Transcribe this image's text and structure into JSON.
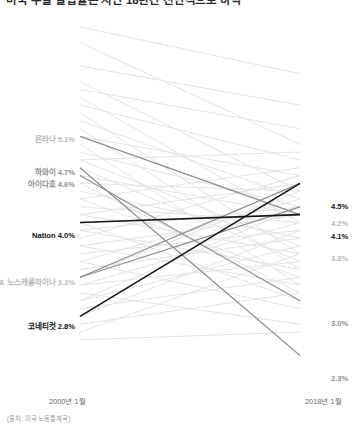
{
  "title": "미국 주별 실업률은 지난 18년간 전반적으로 하락",
  "source_note": "(출처: 미국 노동통계국)",
  "axis": {
    "left_caption": "2000년 1월",
    "right_caption": "2018년 1월"
  },
  "left_labels": [
    {
      "name": "몬타나",
      "value": "5.1%",
      "text": "몬타나 5.1%",
      "tone": "muted"
    },
    {
      "name": "하와이",
      "value": "4.7%",
      "text": "하와이 4.7%",
      "tone": "midtone"
    },
    {
      "name": "아이다호",
      "value": "4.6%",
      "text": "아이다호 4.6%",
      "tone": "midtone"
    },
    {
      "name": "Nation",
      "value": "4.0%",
      "text": "Nation 4.0%",
      "tone": "dark"
    },
    {
      "name": "미시간 & 노스캐롤라이나",
      "value": "3.3%",
      "text": "미시간 & 노스캐롤라이나 3.3%",
      "tone": "muted"
    },
    {
      "name": "코네티컷",
      "value": "2.8%",
      "text": "코네티컷 2.8%",
      "tone": "dark"
    }
  ],
  "right_labels": [
    {
      "value": "4.5%",
      "tone": "dark"
    },
    {
      "value": "4.2%",
      "tone": "muted"
    },
    {
      "value": "4.1%",
      "tone": "dark"
    },
    {
      "value": "3.8%",
      "tone": "muted"
    },
    {
      "value": "3.0%",
      "tone": "midtone"
    },
    {
      "value": "2.3%",
      "tone": "midtone"
    }
  ],
  "colors": {
    "background_line": "#e4e4e4",
    "highlight_line": "#8e8e8e",
    "emphasis_line": "#141414",
    "muted_text": "#b9b9b9",
    "midtone_text": "#8f8f8f",
    "dark_text": "#111111"
  },
  "chart_data": {
    "type": "line",
    "subtype": "slopegraph",
    "title": "미국 주별 실업률은 지난 18년간 전반적으로 하락",
    "xlabel": "",
    "ylabel": "실업률 (%)",
    "x": [
      "2000년 1월",
      "2018년 1월"
    ],
    "ylim": [
      2.0,
      6.6
    ],
    "grid": false,
    "legend": "none",
    "y_axis_inverted_on_screen": true,
    "annotations": {
      "left": [
        "몬타나 5.1%",
        "하와이 4.7%",
        "아이다호 4.6%",
        "Nation 4.0%",
        "미시간 & 노스캐롤라이나 3.3%",
        "코네티컷 2.8%"
      ],
      "right": [
        "4.5%",
        "4.2%",
        "4.1%",
        "3.8%",
        "3.0%",
        "2.3%"
      ]
    },
    "series": [
      {
        "name": "몬타나",
        "values": [
          5.1,
          4.1
        ],
        "emphasis": "highlight"
      },
      {
        "name": "하와이",
        "values": [
          4.7,
          2.3
        ],
        "emphasis": "highlight"
      },
      {
        "name": "아이다호",
        "values": [
          4.6,
          3.0
        ],
        "emphasis": "highlight"
      },
      {
        "name": "Nation",
        "values": [
          4.0,
          4.1
        ],
        "emphasis": "black"
      },
      {
        "name": "미시간",
        "values": [
          3.3,
          4.5
        ],
        "emphasis": "highlight"
      },
      {
        "name": "노스캐롤라이나",
        "values": [
          3.3,
          4.2
        ],
        "emphasis": "highlight"
      },
      {
        "name": "코네티컷",
        "values": [
          2.8,
          4.5
        ],
        "emphasis": "black"
      },
      {
        "name": "기타 주 01",
        "values": [
          6.5,
          5.9
        ],
        "emphasis": "background"
      },
      {
        "name": "기타 주 02",
        "values": [
          6.3,
          5.0
        ],
        "emphasis": "background"
      },
      {
        "name": "기타 주 03",
        "values": [
          6.0,
          5.5
        ],
        "emphasis": "background"
      },
      {
        "name": "기타 주 04",
        "values": [
          5.8,
          4.4
        ],
        "emphasis": "background"
      },
      {
        "name": "기타 주 05",
        "values": [
          5.7,
          5.2
        ],
        "emphasis": "background"
      },
      {
        "name": "기타 주 06",
        "values": [
          5.6,
          4.0
        ],
        "emphasis": "background"
      },
      {
        "name": "기타 주 07",
        "values": [
          5.5,
          4.8
        ],
        "emphasis": "background"
      },
      {
        "name": "기타 주 08",
        "values": [
          5.4,
          3.6
        ],
        "emphasis": "background"
      },
      {
        "name": "기타 주 09",
        "values": [
          5.3,
          4.3
        ],
        "emphasis": "background"
      },
      {
        "name": "기타 주 10",
        "values": [
          5.2,
          3.4
        ],
        "emphasis": "background"
      },
      {
        "name": "기타 주 11",
        "values": [
          5.1,
          4.6
        ],
        "emphasis": "background"
      },
      {
        "name": "기타 주 12",
        "values": [
          5.0,
          3.2
        ],
        "emphasis": "background"
      },
      {
        "name": "기타 주 13",
        "values": [
          4.9,
          4.2
        ],
        "emphasis": "background"
      },
      {
        "name": "기타 주 14",
        "values": [
          4.8,
          3.7
        ],
        "emphasis": "background"
      },
      {
        "name": "기타 주 15",
        "values": [
          4.8,
          4.9
        ],
        "emphasis": "background"
      },
      {
        "name": "기타 주 16",
        "values": [
          4.7,
          3.5
        ],
        "emphasis": "background"
      },
      {
        "name": "기타 주 17",
        "values": [
          4.6,
          4.1
        ],
        "emphasis": "background"
      },
      {
        "name": "기타 주 18",
        "values": [
          4.5,
          3.1
        ],
        "emphasis": "background"
      },
      {
        "name": "기타 주 19",
        "values": [
          4.5,
          4.4
        ],
        "emphasis": "background"
      },
      {
        "name": "기타 주 20",
        "values": [
          4.4,
          3.8
        ],
        "emphasis": "background"
      },
      {
        "name": "기타 주 21",
        "values": [
          4.3,
          4.7
        ],
        "emphasis": "background"
      },
      {
        "name": "기타 주 22",
        "values": [
          4.3,
          3.3
        ],
        "emphasis": "background"
      },
      {
        "name": "기타 주 23",
        "values": [
          4.2,
          4.0
        ],
        "emphasis": "background"
      },
      {
        "name": "기타 주 24",
        "values": [
          4.1,
          3.6
        ],
        "emphasis": "background"
      },
      {
        "name": "기타 주 25",
        "values": [
          4.1,
          4.5
        ],
        "emphasis": "background"
      },
      {
        "name": "기타 주 26",
        "values": [
          4.0,
          3.0
        ],
        "emphasis": "background"
      },
      {
        "name": "기타 주 27",
        "values": [
          3.9,
          4.2
        ],
        "emphasis": "background"
      },
      {
        "name": "기타 주 28",
        "values": [
          3.9,
          3.4
        ],
        "emphasis": "background"
      },
      {
        "name": "기타 주 29",
        "values": [
          3.8,
          4.6
        ],
        "emphasis": "background"
      },
      {
        "name": "기타 주 30",
        "values": [
          3.7,
          3.2
        ],
        "emphasis": "background"
      },
      {
        "name": "기타 주 31",
        "values": [
          3.7,
          4.1
        ],
        "emphasis": "background"
      },
      {
        "name": "기타 주 32",
        "values": [
          3.6,
          3.9
        ],
        "emphasis": "background"
      },
      {
        "name": "기타 주 33",
        "values": [
          3.5,
          4.3
        ],
        "emphasis": "background"
      },
      {
        "name": "기타 주 34",
        "values": [
          3.5,
          2.9
        ],
        "emphasis": "background"
      },
      {
        "name": "기타 주 35",
        "values": [
          3.4,
          3.8
        ],
        "emphasis": "background"
      },
      {
        "name": "기타 주 36",
        "values": [
          3.3,
          4.4
        ],
        "emphasis": "background"
      },
      {
        "name": "기타 주 37",
        "values": [
          3.2,
          3.5
        ],
        "emphasis": "background"
      },
      {
        "name": "기타 주 38",
        "values": [
          3.2,
          4.0
        ],
        "emphasis": "background"
      },
      {
        "name": "기타 주 39",
        "values": [
          3.1,
          2.7
        ],
        "emphasis": "background"
      },
      {
        "name": "기타 주 40",
        "values": [
          3.0,
          3.7
        ],
        "emphasis": "background"
      },
      {
        "name": "기타 주 41",
        "values": [
          3.0,
          4.2
        ],
        "emphasis": "background"
      },
      {
        "name": "기타 주 42",
        "values": [
          2.9,
          3.3
        ],
        "emphasis": "background"
      },
      {
        "name": "기타 주 43",
        "values": [
          2.8,
          3.9
        ],
        "emphasis": "background"
      },
      {
        "name": "기타 주 44",
        "values": [
          2.7,
          3.1
        ],
        "emphasis": "background"
      },
      {
        "name": "기타 주 45",
        "values": [
          2.6,
          3.6
        ],
        "emphasis": "background"
      },
      {
        "name": "기타 주 46",
        "values": [
          2.5,
          2.6
        ],
        "emphasis": "background"
      }
    ]
  }
}
